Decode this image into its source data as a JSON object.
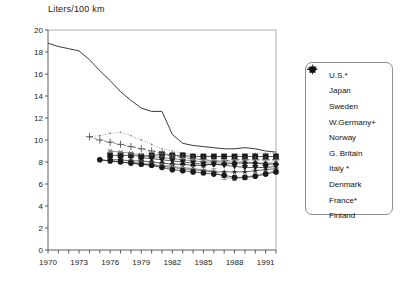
{
  "chart_data": {
    "type": "line",
    "title": "Liters/100 km",
    "xlabel": "",
    "ylabel": "Liters/100 km",
    "xlim": [
      1970,
      1992
    ],
    "ylim": [
      0,
      20
    ],
    "yticks": [
      0,
      2,
      4,
      6,
      8,
      10,
      12,
      14,
      16,
      18,
      20
    ],
    "xticks": [
      1970,
      1973,
      1976,
      1979,
      1982,
      1985,
      1988,
      1991
    ],
    "xtick_all": [
      1970,
      1971,
      1972,
      1973,
      1974,
      1975,
      1976,
      1977,
      1978,
      1979,
      1980,
      1981,
      1982,
      1983,
      1984,
      1985,
      1986,
      1987,
      1988,
      1989,
      1990,
      1991,
      1992
    ],
    "grid": false,
    "legend_position": "right-outside",
    "series": [
      {
        "name": "U.S.*",
        "marker": "none",
        "dash": "solid",
        "color": "#3a3a3a",
        "x": [
          1970,
          1971,
          1972,
          1973,
          1974,
          1975,
          1976,
          1977,
          1978,
          1979,
          1980,
          1981,
          1982,
          1983,
          1984,
          1985,
          1986,
          1987,
          1988,
          1989,
          1990,
          1991,
          1992
        ],
        "values": [
          18.8,
          18.5,
          18.3,
          18.1,
          17.3,
          16.3,
          15.4,
          14.4,
          13.6,
          12.9,
          12.6,
          12.6,
          10.5,
          9.7,
          9.5,
          9.4,
          9.3,
          9.2,
          9.2,
          9.3,
          9.2,
          9.0,
          8.9
        ]
      },
      {
        "name": "Japan",
        "marker": "dots",
        "dash": "dotted",
        "color": "#777777",
        "x": [
          1974,
          1975,
          1976,
          1977,
          1978,
          1979,
          1980,
          1981,
          1982,
          1983,
          1984,
          1985,
          1986,
          1987,
          1988,
          1989,
          1990,
          1991,
          1992
        ],
        "values": [
          10.3,
          10.4,
          10.6,
          10.7,
          10.4,
          10.0,
          9.6,
          9.2,
          9.0,
          8.8,
          8.7,
          8.6,
          8.5,
          8.5,
          8.6,
          8.7,
          8.8,
          8.8,
          8.8
        ]
      },
      {
        "name": "Sweden",
        "marker": "square",
        "dash": "solid",
        "color": "#1a1a1a",
        "x": [
          1976,
          1977,
          1978,
          1979,
          1980,
          1981,
          1982,
          1983,
          1984,
          1985,
          1986,
          1987,
          1988,
          1989,
          1990,
          1991,
          1992
        ],
        "values": [
          8.6,
          8.6,
          8.6,
          8.5,
          8.6,
          8.7,
          8.6,
          8.6,
          8.5,
          8.5,
          8.5,
          8.5,
          8.5,
          8.5,
          8.5,
          8.5,
          8.5
        ]
      },
      {
        "name": "W.Germany+",
        "marker": "plus",
        "dash": "dashed",
        "color": "#555555",
        "x": [
          1974,
          1975,
          1976,
          1977,
          1978,
          1979,
          1980,
          1981,
          1982,
          1983,
          1984,
          1985,
          1986,
          1987,
          1988,
          1989,
          1990,
          1991,
          1992
        ],
        "values": [
          10.3,
          10.0,
          9.8,
          9.6,
          9.4,
          9.2,
          9.0,
          8.8,
          8.6,
          8.4,
          8.3,
          8.2,
          8.1,
          8.1,
          8.2,
          8.2,
          8.2,
          8.2,
          8.2
        ]
      },
      {
        "name": "Norway",
        "marker": "asterisk",
        "dash": "solid",
        "color": "#666666",
        "x": [
          1976,
          1977,
          1978,
          1979,
          1980,
          1981,
          1982,
          1983,
          1984,
          1985,
          1986,
          1987,
          1988,
          1989,
          1990,
          1991,
          1992
        ],
        "values": [
          9.0,
          8.9,
          8.8,
          8.6,
          8.5,
          8.4,
          8.3,
          8.2,
          8.1,
          8.0,
          8.0,
          8.0,
          8.0,
          8.0,
          7.9,
          7.9,
          7.9
        ]
      },
      {
        "name": "G. Britain",
        "marker": "diamond",
        "dash": "solid",
        "color": "#1a1a1a",
        "x": [
          1976,
          1977,
          1978,
          1979,
          1980,
          1981,
          1982,
          1983,
          1984,
          1985,
          1986,
          1987,
          1988,
          1989,
          1990,
          1991,
          1992
        ],
        "values": [
          8.2,
          8.2,
          8.1,
          8.1,
          8.0,
          7.9,
          7.8,
          7.8,
          7.7,
          7.7,
          7.8,
          7.8,
          7.9,
          7.9,
          7.9,
          7.8,
          7.8
        ]
      },
      {
        "name": "Italy *",
        "marker": "star",
        "dash": "solid",
        "color": "#2a2a2a",
        "x": [
          1975,
          1976,
          1977,
          1978,
          1979,
          1980,
          1981,
          1982,
          1983,
          1984,
          1985,
          1986,
          1987,
          1988,
          1989,
          1990,
          1991,
          1992
        ],
        "values": [
          8.2,
          8.1,
          8.0,
          7.9,
          7.8,
          7.7,
          7.6,
          7.5,
          7.4,
          7.3,
          7.2,
          7.1,
          7.1,
          7.1,
          7.1,
          7.2,
          7.3,
          7.4
        ]
      },
      {
        "name": "Denmark",
        "marker": "hbars",
        "dash": "solid",
        "color": "#777777",
        "x": [
          1978,
          1979,
          1980,
          1981,
          1982,
          1983,
          1984,
          1985,
          1986,
          1987,
          1988,
          1989,
          1990,
          1991,
          1992
        ],
        "values": [
          8.0,
          7.9,
          7.8,
          7.7,
          7.6,
          7.5,
          7.4,
          7.3,
          7.2,
          6.6,
          6.5,
          6.6,
          6.8,
          7.0,
          7.2
        ]
      },
      {
        "name": "France*",
        "marker": "circle",
        "dash": "solid",
        "color": "#1a1a1a",
        "x": [
          1975,
          1976,
          1977,
          1978,
          1979,
          1980,
          1981,
          1982,
          1983,
          1984,
          1985,
          1986,
          1987,
          1988,
          1989,
          1990,
          1991,
          1992
        ],
        "values": [
          8.2,
          8.1,
          8.0,
          7.9,
          7.8,
          7.7,
          7.5,
          7.3,
          7.2,
          7.1,
          7.0,
          6.9,
          6.8,
          6.6,
          6.6,
          6.7,
          6.9,
          7.1
        ]
      },
      {
        "name": "Finland",
        "marker": "triangle-down",
        "dash": "solid",
        "color": "#1a1a1a",
        "x": [
          1979,
          1980,
          1981,
          1982,
          1983,
          1984,
          1985,
          1986,
          1987,
          1988,
          1989,
          1990,
          1991,
          1992
        ],
        "values": [
          8.4,
          8.3,
          8.2,
          8.1,
          8.0,
          7.9,
          7.8,
          7.8,
          7.7,
          7.6,
          7.5,
          7.5,
          7.5,
          7.6
        ]
      }
    ]
  },
  "legend": {
    "items": [
      {
        "label": "U.S.*",
        "marker": "line-dash-icon"
      },
      {
        "label": "Japan",
        "marker": "dotted-line-icon"
      },
      {
        "label": "Sweden",
        "marker": "square-marker-icon"
      },
      {
        "label": "W.Germany+",
        "marker": "plus-marker-icon"
      },
      {
        "label": "Norway",
        "marker": "asterisk-marker-icon"
      },
      {
        "label": "G. Britain",
        "marker": "diamond-marker-icon"
      },
      {
        "label": "Italy *",
        "marker": "star-marker-icon"
      },
      {
        "label": "Denmark",
        "marker": "hbars-marker-icon"
      },
      {
        "label": "France*",
        "marker": "circle-marker-icon"
      },
      {
        "label": "Finland",
        "marker": "triangle-down-marker-icon"
      }
    ]
  }
}
